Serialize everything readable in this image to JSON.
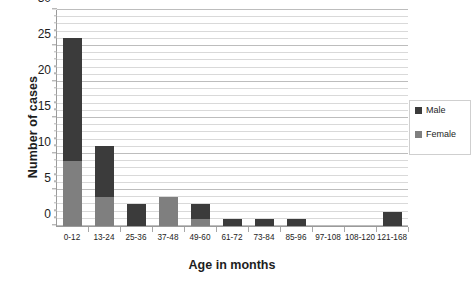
{
  "chart_data": {
    "type": "bar",
    "subtype": "stacked-bar",
    "title": "",
    "xlabel": "Age in months",
    "ylabel": "Number of cases",
    "ylim": [
      0,
      30
    ],
    "ytick_step": 5,
    "minor_gridline_step": 1,
    "grid": true,
    "legend_position": "right",
    "categories": [
      "0-12",
      "13-24",
      "25-36",
      "37-48",
      "49-60",
      "61-72",
      "73-84",
      "85-96",
      "97-108",
      "108-120",
      "121-168"
    ],
    "ytick_labels": [
      "0",
      "5",
      "10",
      "15",
      "20",
      "25",
      "30"
    ],
    "series": [
      {
        "name": "Female",
        "color": "#7f7f7f",
        "values": [
          9,
          4,
          0,
          4,
          1,
          0,
          0,
          0,
          0,
          0,
          0
        ]
      },
      {
        "name": "Male",
        "color": "#3b3b3b",
        "values": [
          17,
          7,
          3,
          0,
          2,
          1,
          1,
          1,
          0,
          0,
          2
        ]
      }
    ],
    "totals": [
      26,
      11,
      3,
      4,
      3,
      1,
      1,
      1,
      0,
      0,
      2
    ]
  },
  "legend": {
    "entries": [
      {
        "label": "Male",
        "swatch": "male-swatch-icon"
      },
      {
        "label": "Female",
        "swatch": "female-swatch-icon"
      }
    ]
  }
}
